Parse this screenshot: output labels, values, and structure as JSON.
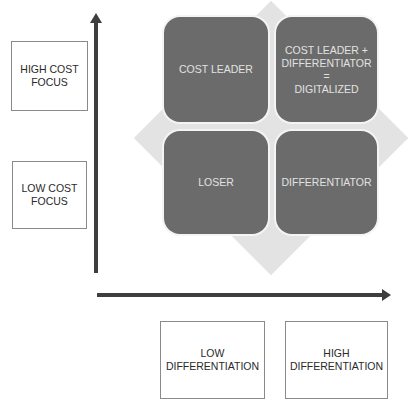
{
  "diagram": {
    "type": "strategy-matrix",
    "y_axis": {
      "direction": "up",
      "labels": [
        {
          "id": "high",
          "text": "HIGH COST FOCUS",
          "line1": "HIGH COST",
          "line2": "FOCUS"
        },
        {
          "id": "low",
          "text": "LOW COST FOCUS",
          "line1": "LOW COST",
          "line2": "FOCUS"
        }
      ]
    },
    "x_axis": {
      "direction": "right",
      "labels": [
        {
          "id": "low",
          "line1": "LOW",
          "line2": "DIFFERENTIATION"
        },
        {
          "id": "high",
          "line1": "HIGH",
          "line2": "DIFFERENTIATION"
        }
      ]
    },
    "quadrants": {
      "top_left": {
        "text": "COST LEADER"
      },
      "top_right": {
        "line1": "COST LEADER +",
        "line2": "DIFFERENTIATOR",
        "line3": "=",
        "line4": "DIGITALIZED"
      },
      "bottom_left": {
        "text": "LOSER"
      },
      "bottom_right": {
        "text": "DIFFERENTIATOR"
      }
    },
    "colors": {
      "quadrant_fill": "#6b6b6b",
      "quadrant_text": "#e2e2e2",
      "diamond_fill": "#e3e3e3",
      "axis": "#3e3e3e",
      "box_border": "#8a8a8a"
    }
  }
}
